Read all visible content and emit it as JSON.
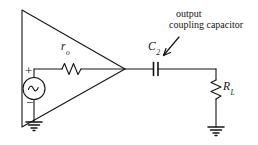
{
  "diagram": {
    "stroke_color": "#141414",
    "background_color": "#ffffff",
    "labels": {
      "output_resistance": "r",
      "output_resistance_sub": "o",
      "coupling_capacitor": "C",
      "coupling_capacitor_sub": "2",
      "load_resistor": "R",
      "load_resistor_sub": "L",
      "source_positive": "+",
      "source_negative": "−",
      "annotation_line1": "output",
      "annotation_line2": "coupling capacitor"
    },
    "components": [
      {
        "name": "amplifier-triangle",
        "type": "triangle"
      },
      {
        "name": "ac-source",
        "type": "ac-voltage-source"
      },
      {
        "name": "output-resistor",
        "type": "resistor-horizontal"
      },
      {
        "name": "coupling-capacitor",
        "type": "capacitor"
      },
      {
        "name": "load-resistor",
        "type": "resistor-vertical"
      },
      {
        "name": "source-ground",
        "type": "ground"
      },
      {
        "name": "load-ground",
        "type": "ground"
      },
      {
        "name": "annotation-arrow",
        "type": "arrow"
      }
    ]
  }
}
